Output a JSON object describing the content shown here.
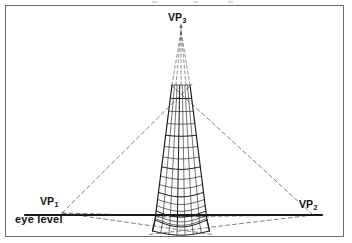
{
  "figure": {
    "type": "three-point-perspective-construction-drawing",
    "title": "",
    "background_color": "#ffffff",
    "frame": {
      "present": true,
      "color": "#6b6b6b",
      "x": 5,
      "y": 5,
      "width": 339,
      "height": 232
    }
  },
  "labels": {
    "vp1": {
      "text": "VP",
      "sub": "1",
      "x": 40,
      "y": 196
    },
    "vp2": {
      "text": "VP",
      "sub": "2",
      "x": 299,
      "y": 199
    },
    "vp3": {
      "text": "VP",
      "sub": "3",
      "x": 168,
      "y": 12
    },
    "eye_level": {
      "text": "eye level",
      "x": 15,
      "y": 214
    }
  },
  "colors": {
    "ink": "#111111",
    "solid_line": "#1a1a1a",
    "dashed_line": "#555555",
    "frame": "#6b6b6b",
    "paper": "#ffffff"
  },
  "geometry": {
    "vanishing_points": {
      "vp1": {
        "x": 62,
        "y": 213
      },
      "vp2": {
        "x": 313,
        "y": 215
      },
      "vp3": {
        "x": 181,
        "y": 31
      }
    },
    "horizon_line": {
      "name": "eye level",
      "x1": 25,
      "y1": 215,
      "x2": 322,
      "y2": 215,
      "thickness": 2.2
    },
    "tower": {
      "apex_cut_y": 85,
      "base_front_y": 220,
      "base_bottom_y": 231,
      "top_left_x": 172,
      "top_right_x": 190,
      "base_left_x": 155,
      "base_right_x": 207,
      "vertical_rib_count": 8,
      "horizontal_band_count": 16
    },
    "dashed_construction_lines": {
      "from_vp3_count": 6,
      "from_vp1_count": 3,
      "from_vp2_count": 3
    }
  }
}
